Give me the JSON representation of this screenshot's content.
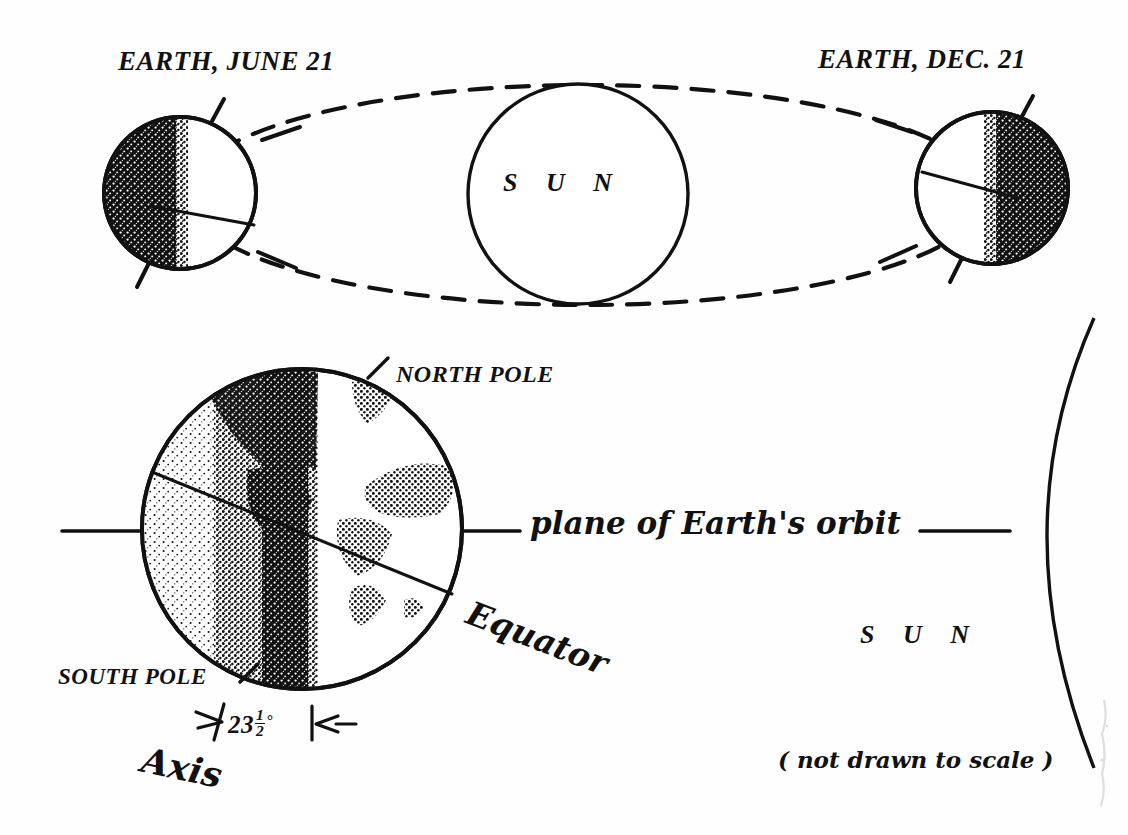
{
  "diagram": {
    "background_color": "#fefefe",
    "ink_color": "#111111"
  },
  "orbit_view": {
    "earth_june_label": "EARTH, JUNE 21",
    "earth_dec_label": "EARTH, DEC. 21",
    "sun_label": "S U N",
    "orbit_style": "dashed ellipse",
    "june_night_side": "left",
    "dec_night_side": "right"
  },
  "detail_view": {
    "north_pole_label": "NORTH POLE",
    "south_pole_label": "SOUTH POLE",
    "equator_label": "Equator",
    "axis_label": "Axis",
    "plane_label": "plane of Earth's orbit",
    "sun_label": "S U N",
    "scale_note": "( not drawn to scale )",
    "tilt": {
      "whole": "23",
      "numerator": "1",
      "denominator": "2",
      "degree_symbol": "°",
      "full_text": "23 1/2 degrees"
    }
  }
}
